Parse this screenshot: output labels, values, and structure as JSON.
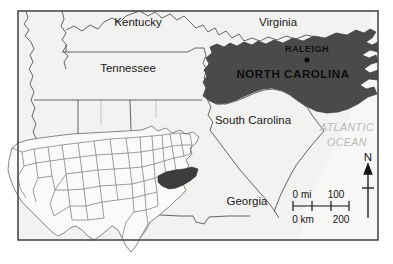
{
  "map": {
    "title": "North Carolina Locator Map",
    "frame": {
      "border_color": "#4a4a4a"
    },
    "colors": {
      "land": "#f2f2f0",
      "highlight": "#4a4a4a",
      "ocean_text": "#b9b9b9",
      "border": "#555555",
      "text": "#1a1a1a"
    },
    "state_labels": [
      {
        "name": "kentucky",
        "text": "Kentucky",
        "x": 138,
        "y": 26
      },
      {
        "name": "tennessee",
        "text": "Tennessee",
        "x": 128,
        "y": 72
      },
      {
        "name": "virginia",
        "text": "Virginia",
        "x": 278,
        "y": 26
      },
      {
        "name": "south-carolina",
        "text": "South Carolina",
        "x": 253,
        "y": 124
      },
      {
        "name": "georgia",
        "text": "Georgia",
        "x": 247,
        "y": 205
      }
    ],
    "highlighted_state": {
      "name": "north-carolina",
      "label": "NORTH CAROLINA",
      "label_x": 293,
      "label_y": 74
    },
    "capital": {
      "name": "raleigh",
      "label": "RALEIGH",
      "label_x": 307,
      "label_y": 52,
      "dot_x": 307,
      "dot_y": 60
    },
    "ocean": {
      "line1": "ATLANTIC",
      "line2": "OCEAN",
      "x": 347,
      "y1": 131,
      "y2": 146
    },
    "scale_bar": {
      "miles_unit": "0 mi",
      "miles_value": "100",
      "km_unit": "0 km",
      "km_value": "200",
      "x_start": 293,
      "x_end": 349,
      "y": 204,
      "ticks": 4
    },
    "north_arrow": {
      "label": "N",
      "x": 368,
      "label_y": 160,
      "top_y": 165,
      "bottom_y": 216
    },
    "inset": {
      "name": "united-states-inset",
      "highlighted_state": "north-carolina"
    }
  }
}
